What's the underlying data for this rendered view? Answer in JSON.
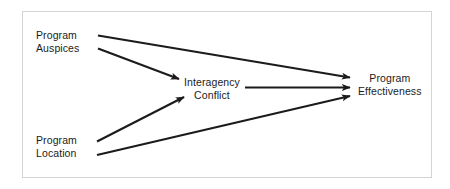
{
  "diagram": {
    "title": "",
    "background_color": "#ffffff",
    "frame_color": "#d4d4d4",
    "line_color": "#1b1b1b",
    "text_color": "#1b1b1b",
    "nodes": [
      {
        "id": "program-auspices",
        "line1": "Program",
        "line2": "Auspices"
      },
      {
        "id": "program-location",
        "line1": "Program",
        "line2": "Location"
      },
      {
        "id": "interagency-conflict",
        "line1": "Interagency",
        "line2": "Conflict"
      },
      {
        "id": "program-effectiveness",
        "line1": "Program",
        "line2": "Effectiveness"
      }
    ],
    "edges": [
      {
        "id": "auspices-to-effectiveness",
        "from": "program-auspices",
        "to": "program-effectiveness",
        "label": ""
      },
      {
        "id": "auspices-to-conflict",
        "from": "program-auspices",
        "to": "interagency-conflict",
        "label": ""
      },
      {
        "id": "location-to-conflict",
        "from": "program-location",
        "to": "interagency-conflict",
        "label": ""
      },
      {
        "id": "location-to-effectiveness",
        "from": "program-location",
        "to": "program-effectiveness",
        "label": ""
      },
      {
        "id": "conflict-to-effectiveness",
        "from": "interagency-conflict",
        "to": "program-effectiveness",
        "label": ""
      }
    ]
  }
}
